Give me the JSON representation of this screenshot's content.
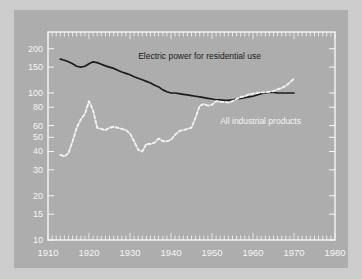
{
  "figure": {
    "background_color": "#cccccc",
    "plot_background_color": "#adadad",
    "frame_color": "#f5f5f5"
  },
  "chart_data": {
    "type": "line",
    "title": "",
    "subtitle": "",
    "xlabel": "",
    "ylabel": "",
    "yscale": "log",
    "xscale": "linear",
    "xlim": [
      1910,
      1980
    ],
    "ylim": [
      10,
      260
    ],
    "grid": false,
    "legend": "inline-annotations",
    "xticks": [
      1910,
      1920,
      1930,
      1940,
      1950,
      1960,
      1970,
      1980
    ],
    "xticklabels": [
      "1910",
      "1920",
      "1930",
      "1940",
      "1950",
      "1960",
      "1970",
      "1980"
    ],
    "minor_xticks": "every year",
    "yticks": [
      10,
      15,
      20,
      30,
      40,
      50,
      60,
      80,
      100,
      150,
      200
    ],
    "yticklabels": [
      "10",
      "15",
      "20",
      "30",
      "40",
      "50",
      "60",
      "80",
      "100",
      "150",
      "200"
    ],
    "series": [
      {
        "name": "Electric power for residential use",
        "color": "#1c1c1c",
        "style": "solid",
        "label_x": 1932,
        "label_y": 170,
        "x": [
          1913,
          1914,
          1915,
          1916,
          1917,
          1918,
          1919,
          1920,
          1921,
          1922,
          1923,
          1924,
          1925,
          1926,
          1927,
          1928,
          1929,
          1930,
          1931,
          1932,
          1933,
          1934,
          1935,
          1936,
          1937,
          1938,
          1939,
          1940,
          1941,
          1942,
          1943,
          1944,
          1945,
          1946,
          1947,
          1948,
          1949,
          1950,
          1951,
          1952,
          1953,
          1954,
          1955,
          1956,
          1957,
          1958,
          1959,
          1960,
          1961,
          1962,
          1963,
          1964,
          1965,
          1966,
          1967,
          1968,
          1969,
          1970
        ],
        "y": [
          170,
          167,
          163,
          158,
          152,
          150,
          152,
          158,
          163,
          161,
          157,
          153,
          150,
          147,
          143,
          139,
          136,
          133,
          129,
          126,
          123,
          120,
          117,
          113,
          110,
          105,
          102,
          100,
          100,
          99,
          98,
          97,
          96,
          95,
          94,
          93,
          92,
          91,
          90,
          90,
          89,
          89,
          90,
          91,
          92,
          93,
          94,
          95,
          97,
          99,
          100,
          101,
          101,
          100,
          100,
          100,
          100,
          100
        ]
      },
      {
        "name": "All industrial products",
        "color": "#f2f2f2",
        "style": "dashed",
        "label_x": 1952,
        "label_y": 62,
        "x": [
          1913,
          1914,
          1915,
          1916,
          1917,
          1918,
          1919,
          1920,
          1921,
          1922,
          1923,
          1924,
          1925,
          1926,
          1927,
          1928,
          1929,
          1930,
          1931,
          1932,
          1933,
          1934,
          1935,
          1936,
          1937,
          1938,
          1939,
          1940,
          1941,
          1942,
          1943,
          1944,
          1945,
          1946,
          1947,
          1948,
          1949,
          1950,
          1951,
          1952,
          1953,
          1954,
          1955,
          1956,
          1957,
          1958,
          1959,
          1960,
          1961,
          1962,
          1963,
          1964,
          1965,
          1966,
          1967,
          1968,
          1969,
          1970
        ],
        "y": [
          38,
          37,
          39,
          47,
          58,
          66,
          72,
          88,
          76,
          58,
          57,
          56,
          58,
          59,
          58,
          57,
          56,
          53,
          47,
          41,
          40,
          45,
          45,
          46,
          49,
          47,
          47,
          48,
          52,
          55,
          56,
          57,
          58,
          68,
          82,
          84,
          82,
          83,
          88,
          87,
          87,
          86,
          88,
          91,
          94,
          95,
          98,
          99,
          100,
          101,
          101,
          102,
          103,
          106,
          108,
          112,
          118,
          125
        ]
      }
    ]
  },
  "axes": {
    "x_tick_labels": [
      "1910",
      "1920",
      "1930",
      "1940",
      "1950",
      "1960",
      "1970",
      "1980"
    ],
    "y_tick_labels": [
      "200",
      "150",
      "100",
      "80",
      "60",
      "50",
      "40",
      "30",
      "20",
      "15",
      "10"
    ]
  },
  "annotations": [
    {
      "name": "electric-power-label",
      "text": "Electric power for residential use"
    },
    {
      "name": "industrial-products-label",
      "text": "All industrial products"
    }
  ]
}
